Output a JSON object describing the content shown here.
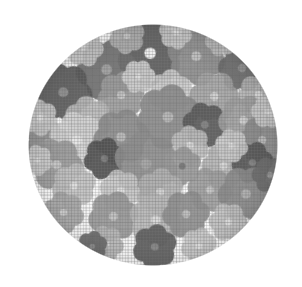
{
  "image": {
    "subject": "floral-print fabric swatch",
    "shape": "rounded-square",
    "background_color": "#ffffff",
    "cloth_color": "#fbfbfb",
    "motif": "six-petal daisy flowers",
    "palette": [
      "#4a4a4a",
      "#5d5d5d",
      "#717171",
      "#848484",
      "#9a9a9a",
      "#b0b0b0",
      "#c4c4c4",
      "#d6d6d6",
      "#e2e2e2"
    ],
    "swatch": {
      "left": 28,
      "top": 24,
      "width": 250,
      "height": 242,
      "corner_radius": "46%"
    }
  },
  "flowers": [
    {
      "x": 150,
      "y": 53,
      "r": 24,
      "fill": "#5a5a5a",
      "center": "#efefef",
      "rot": 8
    },
    {
      "x": 107,
      "y": 70,
      "r": 22,
      "fill": "#6e6e6e",
      "center": "#9c9c9c",
      "rot": 22
    },
    {
      "x": 196,
      "y": 56,
      "r": 21,
      "fill": "#8d8d8d",
      "center": "#bdbdbd",
      "rot": -12
    },
    {
      "x": 242,
      "y": 68,
      "r": 17,
      "fill": "#6a6a6a",
      "center": "#8f8f8f",
      "rot": 34
    },
    {
      "x": 63,
      "y": 92,
      "r": 21,
      "fill": "#585858",
      "center": "#8a8a8a",
      "rot": -20
    },
    {
      "x": 121,
      "y": 95,
      "r": 17,
      "fill": "#9d9d9d",
      "center": "#c6c6c6",
      "rot": 15
    },
    {
      "x": 170,
      "y": 92,
      "r": 16,
      "fill": "#c9c9c9",
      "center": "#dedede",
      "rot": 5
    },
    {
      "x": 214,
      "y": 96,
      "r": 18,
      "fill": "#a3a3a3",
      "center": "#cccccc",
      "rot": -28
    },
    {
      "x": 258,
      "y": 94,
      "r": 15,
      "fill": "#b6b6b6",
      "center": "#d8d8d8",
      "rot": 18
    },
    {
      "x": 88,
      "y": 120,
      "r": 17,
      "fill": "#b9b9b9",
      "center": "#d9d9d9",
      "rot": -8
    },
    {
      "x": 168,
      "y": 117,
      "r": 23,
      "fill": "#8a8a8a",
      "center": "#b2b2b2",
      "rot": 12
    },
    {
      "x": 205,
      "y": 125,
      "r": 16,
      "fill": "#575757",
      "center": "#7c7c7c",
      "rot": -18
    },
    {
      "x": 243,
      "y": 120,
      "r": 18,
      "fill": "#9f9f9f",
      "center": "#c8c8c8",
      "rot": 26
    },
    {
      "x": 48,
      "y": 143,
      "r": 16,
      "fill": "#8f8f8f",
      "center": "#bcbcbc",
      "rot": 10
    },
    {
      "x": 77,
      "y": 140,
      "r": 20,
      "fill": "#d2d2d2",
      "center": "#e4e4e4",
      "rot": -14
    },
    {
      "x": 121,
      "y": 137,
      "r": 20,
      "fill": "#8b8b8b",
      "center": "#b4b4b4",
      "rot": 20
    },
    {
      "x": 190,
      "y": 145,
      "r": 14,
      "fill": "#bdbdbd",
      "center": "#dadada",
      "rot": -6
    },
    {
      "x": 262,
      "y": 140,
      "r": 17,
      "fill": "#8c8c8c",
      "center": "#b6b6b6",
      "rot": 30
    },
    {
      "x": 57,
      "y": 165,
      "r": 19,
      "fill": "#9b9b9b",
      "center": "#c5c5c5",
      "rot": -24
    },
    {
      "x": 104,
      "y": 158,
      "r": 15,
      "fill": "#4e4e4e",
      "center": "#767676",
      "rot": 16
    },
    {
      "x": 146,
      "y": 164,
      "r": 23,
      "fill": "#8e8e8e",
      "center": "#a0a0a0",
      "rot": -10
    },
    {
      "x": 182,
      "y": 166,
      "r": 14,
      "fill": "#9a9a9a",
      "center": "#6f6f6f",
      "rot": 8
    },
    {
      "x": 224,
      "y": 166,
      "r": 16,
      "fill": "#b4b4b4",
      "center": "#d4d4d4",
      "rot": -30
    },
    {
      "x": 252,
      "y": 162,
      "r": 15,
      "fill": "#555555",
      "center": "#7d7d7d",
      "rot": 22
    },
    {
      "x": 74,
      "y": 186,
      "r": 16,
      "fill": "#c0c0c0",
      "center": "#dcdcdc",
      "rot": 12
    },
    {
      "x": 120,
      "y": 190,
      "r": 15,
      "fill": "#c6c6c6",
      "center": "#dfdfdf",
      "rot": -16
    },
    {
      "x": 160,
      "y": 192,
      "r": 17,
      "fill": "#b2b2b2",
      "center": "#d2d2d2",
      "rot": 6
    },
    {
      "x": 210,
      "y": 190,
      "r": 16,
      "fill": "#9d9d9d",
      "center": "#c3c3c3",
      "rot": -20
    },
    {
      "x": 246,
      "y": 194,
      "r": 20,
      "fill": "#8a8a8a",
      "center": "#b0b0b0",
      "rot": 28
    },
    {
      "x": 63,
      "y": 212,
      "r": 15,
      "fill": "#a8a8a8",
      "center": "#cfcfcf",
      "rot": -12
    },
    {
      "x": 113,
      "y": 216,
      "r": 18,
      "fill": "#979797",
      "center": "#c0c0c0",
      "rot": 18
    },
    {
      "x": 156,
      "y": 220,
      "r": 19,
      "fill": "#b7b7b7",
      "center": "#d6d6d6",
      "rot": -8
    },
    {
      "x": 186,
      "y": 214,
      "r": 17,
      "fill": "#8f8f8f",
      "center": "#bababa",
      "rot": 24
    },
    {
      "x": 228,
      "y": 222,
      "r": 14,
      "fill": "#c2c2c2",
      "center": "#dddddd",
      "rot": -26
    },
    {
      "x": 155,
      "y": 247,
      "r": 16,
      "fill": "#5c5c5c",
      "center": "#848484",
      "rot": 10
    },
    {
      "x": 106,
      "y": 244,
      "r": 13,
      "fill": "#b9b9b9",
      "center": "#d8d8d8",
      "rot": -18
    },
    {
      "x": 199,
      "y": 246,
      "r": 13,
      "fill": "#cacaca",
      "center": "#e0e0e0",
      "rot": 14
    },
    {
      "x": 84,
      "y": 47,
      "r": 14,
      "fill": "#c8c8c8",
      "center": "#e0e0e0",
      "rot": -22
    },
    {
      "x": 127,
      "y": 36,
      "r": 13,
      "fill": "#b4b4b4",
      "center": "#d4d4d4",
      "rot": 8
    },
    {
      "x": 176,
      "y": 33,
      "r": 12,
      "fill": "#cecece",
      "center": "#e3e3e3",
      "rot": -14
    },
    {
      "x": 222,
      "y": 40,
      "r": 12,
      "fill": "#bfbfbf",
      "center": "#dcdcdc",
      "rot": 20
    },
    {
      "x": 40,
      "y": 118,
      "r": 13,
      "fill": "#cbcbcb",
      "center": "#e1e1e1",
      "rot": -6
    },
    {
      "x": 270,
      "y": 175,
      "r": 13,
      "fill": "#6d6d6d",
      "center": "#969696",
      "rot": 32
    },
    {
      "x": 268,
      "y": 112,
      "r": 12,
      "fill": "#cdcdcd",
      "center": "#e2e2e2",
      "rot": -28
    },
    {
      "x": 92,
      "y": 246,
      "r": 11,
      "fill": "#6a6a6a",
      "center": "#8e8e8e",
      "rot": 12
    },
    {
      "x": 37,
      "y": 160,
      "r": 11,
      "fill": "#d0d0d0",
      "center": "#e4e4e4",
      "rot": -10
    },
    {
      "x": 139,
      "y": 77,
      "r": 12,
      "fill": "#cfcfcf",
      "center": "#e4e4e4",
      "rot": 26
    },
    {
      "x": 232,
      "y": 146,
      "r": 12,
      "fill": "#c7c7c7",
      "center": "#dfdfdf",
      "rot": -16
    }
  ]
}
